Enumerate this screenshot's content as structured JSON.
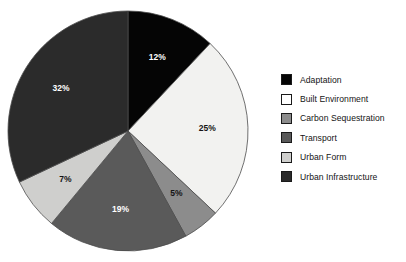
{
  "chart_data": {
    "type": "pie",
    "title": "",
    "subtitle": "",
    "xlabel": "",
    "ylabel": "",
    "grid": false,
    "legend_position": "right",
    "start_angle_deg": 0,
    "direction": "clockwise",
    "units": "percent",
    "total": 100,
    "categories": [
      "Adaptation",
      "Built Environment",
      "Carbon Sequestration",
      "Transport",
      "Urban Form",
      "Urban Infrastructure"
    ],
    "values": [
      12,
      25,
      5,
      19,
      7,
      32
    ],
    "data_labels": [
      "12%",
      "25%",
      "5%",
      "19%",
      "7%",
      "32%"
    ],
    "slice_colors": [
      "#050505",
      "#f2f2f0",
      "#8c8c8c",
      "#5a5a5a",
      "#cfcfcd",
      "#2b2b2b"
    ],
    "slice_label_colors": [
      "#ffffff",
      "#141414",
      "#141414",
      "#ffffff",
      "#141414",
      "#ffffff"
    ],
    "slice_edge_color": "#4d4d4d",
    "background_color": "#ffffff"
  },
  "legend": {
    "items": [
      {
        "label": "Adaptation",
        "swatch": "#050505"
      },
      {
        "label": "Built Environment",
        "swatch": "#ffffff"
      },
      {
        "label": "Carbon Sequestration",
        "swatch": "#8c8c8c"
      },
      {
        "label": "Transport",
        "swatch": "#5a5a5a"
      },
      {
        "label": "Urban Form",
        "swatch": "#cfcfcd"
      },
      {
        "label": "Urban Infrastructure",
        "swatch": "#2b2b2b"
      }
    ]
  }
}
